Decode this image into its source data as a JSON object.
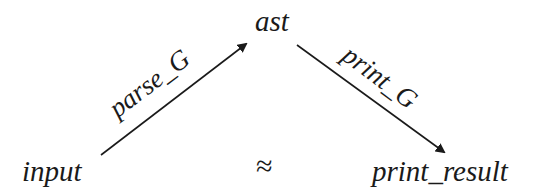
{
  "diagram": {
    "nodes": {
      "input": "input",
      "ast": "ast",
      "print_result": "print_result"
    },
    "edges": [
      {
        "from": "input",
        "to": "ast",
        "label": "parse_G"
      },
      {
        "from": "ast",
        "to": "print_result",
        "label": "print_G"
      }
    ],
    "relation": {
      "between": [
        "input",
        "print_result"
      ],
      "symbol": "≈"
    },
    "colors": {
      "ink": "#1a1a1a",
      "background": "#ffffff"
    }
  }
}
